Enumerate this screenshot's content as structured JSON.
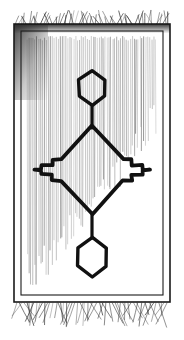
{
  "artwork": {
    "title": "Hand-drawn oriental rug",
    "medium": "pen-and-ink line drawing",
    "subject": "rug-with-medallion",
    "canvas": {
      "width": 184,
      "height": 340,
      "background": "#ffffff"
    },
    "ink_color": "#1a1a1a",
    "hatch_color": "#555555",
    "fringe_color": "#3a3a3a",
    "shadow_color": "#2b2b2b"
  },
  "rug": {
    "body": {
      "x": 14,
      "y": 24,
      "width": 156,
      "height": 278
    },
    "outer_border": {
      "x": 14,
      "y": 24,
      "width": 156,
      "height": 278,
      "stroke_width": 1.6
    },
    "inner_border": {
      "x": 21,
      "y": 31,
      "width": 142,
      "height": 264,
      "stroke_width": 1.1
    },
    "field": {
      "x": 26,
      "y": 36,
      "width": 132,
      "height": 254
    },
    "corner_shadow": {
      "position": "top-left",
      "note": "heavy dark wash along top edge and upper-left edge"
    }
  },
  "fringe": {
    "top": {
      "y": 24,
      "length": 12,
      "strand_count": 62,
      "style": "short-splayed"
    },
    "bottom": {
      "y": 302,
      "length": 22,
      "strand_count": 58,
      "style": "long-splayed"
    }
  },
  "field_hatching": {
    "description": "fine vertical warp lines filling the field, densest at left and center, fading toward bottom and right",
    "line_count": 68,
    "spacing": 1.95,
    "top": 38,
    "fade_zone_start": 200
  },
  "motifs": {
    "top_hexagon": {
      "name": "upper-hexagon-medallion",
      "center_x": 92,
      "center_y": 88,
      "half_width": 13,
      "half_height": 17,
      "shoulder": 8,
      "stroke_width": 3.4
    },
    "upper_stem": {
      "x": 92,
      "y_top": 105,
      "y_bottom": 128,
      "stroke_width": 3.2
    },
    "central_diamond": {
      "name": "stepped-diamond-medallion",
      "center_x": 92,
      "center_y": 170,
      "half_width": 58,
      "half_height": 44,
      "step_count": 2,
      "stroke_width": 3.8
    },
    "lower_stem": {
      "x": 92,
      "y_top": 213,
      "y_bottom": 238,
      "stroke_width": 3.2
    },
    "bottom_hexagon": {
      "name": "lower-hexagon-medallion",
      "center_x": 92,
      "center_y": 257,
      "half_width": 14,
      "half_height": 20,
      "shoulder": 9,
      "stroke_width": 3.4
    }
  }
}
